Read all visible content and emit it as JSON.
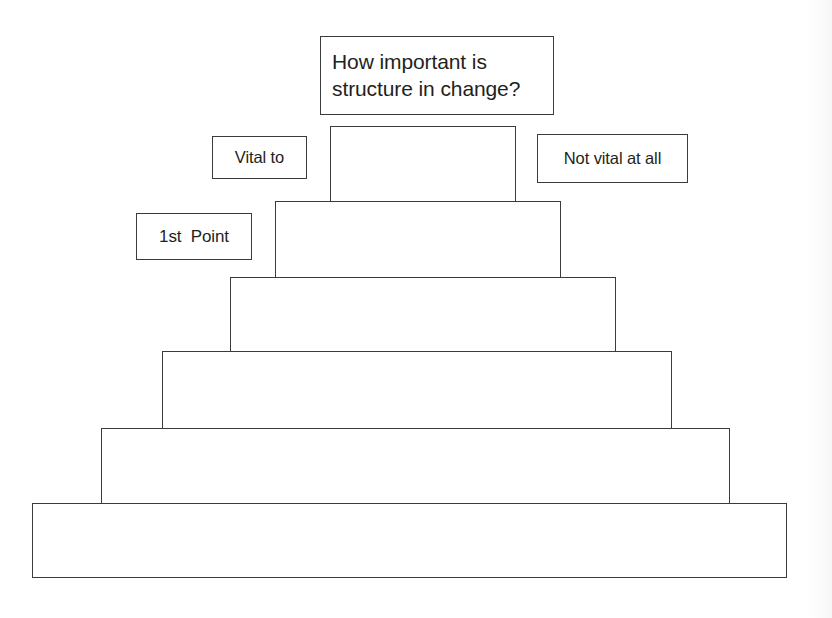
{
  "diagram": {
    "type": "pyramid",
    "title_box": {
      "text": "How important is\nstructure in change?",
      "x": 320,
      "y": 36,
      "w": 234,
      "h": 79
    },
    "labels": [
      {
        "name": "vital-to",
        "text": "Vital to",
        "x": 212,
        "y": 136,
        "w": 95,
        "h": 43
      },
      {
        "name": "not-vital-at-all",
        "text": "Not vital at all",
        "x": 537,
        "y": 134,
        "w": 151,
        "h": 49
      },
      {
        "name": "first-point",
        "text": "1st  Point",
        "x": 136,
        "y": 213,
        "w": 116,
        "h": 47
      }
    ],
    "tiers": [
      {
        "level": 1,
        "label": "",
        "x": 330,
        "y": 126,
        "w": 186,
        "h": 76
      },
      {
        "level": 2,
        "label": "",
        "x": 275,
        "y": 201,
        "w": 286,
        "h": 77
      },
      {
        "level": 3,
        "label": "",
        "x": 230,
        "y": 277,
        "w": 386,
        "h": 75
      },
      {
        "level": 4,
        "label": "",
        "x": 162,
        "y": 351,
        "w": 510,
        "h": 78
      },
      {
        "level": 5,
        "label": "",
        "x": 101,
        "y": 428,
        "w": 629,
        "h": 76
      },
      {
        "level": 6,
        "label": "",
        "x": 32,
        "y": 503,
        "w": 755,
        "h": 75
      }
    ],
    "colors": {
      "background": "#ffffff",
      "stroke": "#3b3b3b",
      "text": "#231f20"
    }
  }
}
